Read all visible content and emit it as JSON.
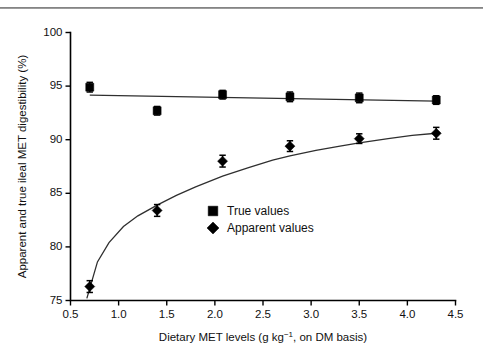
{
  "figure": {
    "top_rule": "horizontal-rule",
    "background": "#ffffff"
  },
  "chart_data": {
    "type": "scatter",
    "title": "",
    "subtitle": "",
    "xlabel_parts": {
      "pre": "Dietary MET levels (g kg",
      "sup": "−1",
      "post": ", on DM basis)"
    },
    "xlabel": "Dietary MET levels (g kg−1, on DM basis)",
    "ylabel": "Apparent and true ileal MET digestibility (%)",
    "xlim": [
      0.5,
      4.5
    ],
    "ylim": [
      75,
      100
    ],
    "xticks": [
      0.5,
      1.0,
      1.5,
      2.0,
      2.5,
      3.0,
      3.5,
      4.0,
      4.5
    ],
    "xtick_labels": [
      "0.5",
      "1.0",
      "1.5",
      "2.0",
      "2.5",
      "3.0",
      "3.5",
      "4.0",
      "4.5"
    ],
    "yticks": [
      75,
      80,
      85,
      90,
      95,
      100
    ],
    "ytick_labels": [
      "75",
      "80",
      "85",
      "90",
      "95",
      "100"
    ],
    "grid": false,
    "legend_position": "center",
    "x": [
      0.7,
      1.4,
      2.08,
      2.78,
      3.5,
      4.3
    ],
    "series": [
      {
        "name": "True values",
        "marker": "square",
        "color": "#000000",
        "values": [
          94.9,
          92.7,
          94.2,
          94.0,
          93.9,
          93.7
        ],
        "errors": [
          0.45,
          0.4,
          0.4,
          0.45,
          0.45,
          0.4
        ],
        "fit": {
          "kind": "linear",
          "points": [
            [
              0.7,
              94.15
            ],
            [
              4.3,
              93.6
            ]
          ]
        }
      },
      {
        "name": "Apparent values",
        "marker": "diamond",
        "color": "#000000",
        "values": [
          76.3,
          83.4,
          88.0,
          89.4,
          90.1,
          90.6
        ],
        "errors": [
          0.55,
          0.55,
          0.55,
          0.5,
          0.45,
          0.55
        ],
        "fit": {
          "kind": "asymptotic",
          "points": [
            [
              0.67,
              75.2
            ],
            [
              0.78,
              78.6
            ],
            [
              0.9,
              80.4
            ],
            [
              1.05,
              81.9
            ],
            [
              1.2,
              82.9
            ],
            [
              1.4,
              83.9
            ],
            [
              1.6,
              84.8
            ],
            [
              1.8,
              85.6
            ],
            [
              2.08,
              86.6
            ],
            [
              2.35,
              87.4
            ],
            [
              2.6,
              88.1
            ],
            [
              2.78,
              88.5
            ],
            [
              3.05,
              89.0
            ],
            [
              3.3,
              89.4
            ],
            [
              3.5,
              89.7
            ],
            [
              3.8,
              90.1
            ],
            [
              4.05,
              90.4
            ],
            [
              4.3,
              90.6
            ]
          ]
        }
      }
    ],
    "legend": [
      {
        "label": "True values",
        "marker": "square"
      },
      {
        "label": "Apparent values",
        "marker": "diamond"
      }
    ]
  }
}
